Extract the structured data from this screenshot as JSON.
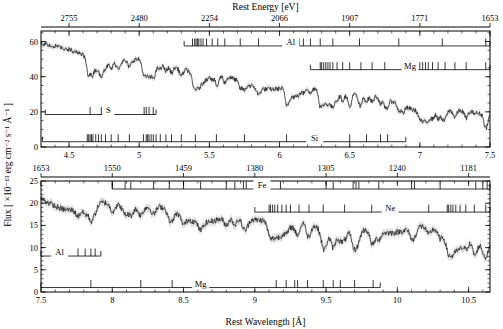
{
  "figure": {
    "type": "scientific-spectrum-figure",
    "top_axis_title": "Rest Energy [eV]",
    "bottom_axis_title": "Rest Wavelength [Å]",
    "y_axis_title": "Flux [ ×10⁻¹³ erg cm⁻² s⁻¹ Å⁻¹ ]"
  },
  "chart_data": {
    "type": "line",
    "title": "",
    "subtitle": "",
    "xlabel": "Rest Wavelength [Å]",
    "ylabel": "Flux [ ×10⁻¹³ erg cm⁻² s⁻¹ Å⁻¹ ]",
    "secondary_xlabel": "Rest Energy [eV]",
    "grid": false,
    "legend": "none",
    "panels": [
      {
        "name": "top-panel",
        "xlim": [
          4.3,
          7.5
        ],
        "ylim": [
          0,
          66
        ],
        "yticks": [
          0,
          20,
          40,
          60
        ],
        "ytick_labels": [
          "0",
          "20",
          "40",
          "60"
        ],
        "xticks": [
          4.5,
          5.0,
          5.5,
          6.0,
          6.5,
          7.0,
          7.5
        ],
        "xtick_labels": [
          "4.5",
          "5",
          "5.5",
          "6",
          "6.5",
          "7",
          "7.5"
        ],
        "energy_ticks": [
          2755,
          2480,
          2254,
          2066,
          1907,
          1771,
          1653
        ],
        "energy_tick_labels": [
          "2755",
          "2480",
          "2254",
          "2066",
          "1907",
          "1771",
          "1653"
        ],
        "energy_tick_wavelengths": [
          4.5,
          5.0,
          5.5,
          6.0,
          6.5,
          7.0,
          7.5
        ],
        "ion_markers": [
          {
            "label": "Al",
            "label_x": 6.08,
            "row_y": 57.5,
            "bar_start": 5.32,
            "bar_end": 7.5,
            "lines": [
              5.38,
              5.395,
              5.405,
              5.415,
              5.425,
              5.44,
              5.455,
              5.48,
              5.52,
              5.56,
              5.61,
              5.72,
              5.85,
              6.05,
              6.06,
              6.08,
              6.1,
              6.12,
              6.14,
              6.17,
              6.22,
              6.29,
              6.38,
              6.57,
              6.85,
              7.16,
              7.47
            ]
          },
          {
            "label": "Mg",
            "label_x": 6.93,
            "row_y": 44.0,
            "bar_start": 6.22,
            "bar_end": 7.5,
            "lines": [
              6.29,
              6.3,
              6.315,
              6.33,
              6.345,
              6.36,
              6.38,
              6.41,
              6.45,
              6.5,
              6.58,
              6.66,
              6.75,
              6.88,
              7.0,
              7.02,
              7.04,
              7.06,
              7.09,
              7.13,
              7.18,
              7.25,
              7.33,
              7.47
            ]
          },
          {
            "label": "S",
            "label_x": 4.78,
            "row_y": 18.5,
            "bar_start": 4.33,
            "bar_end": 5.12,
            "lines": [
              4.65,
              4.73,
              5.035,
              5.05,
              5.07,
              5.1
            ]
          },
          {
            "label": "Si",
            "label_x": 6.25,
            "row_y": 3.0,
            "bar_start": 4.31,
            "bar_end": 6.9,
            "lines": [
              4.63,
              4.64,
              4.65,
              4.66,
              4.67,
              4.69,
              4.71,
              4.73,
              4.76,
              4.8,
              4.85,
              4.93,
              5.03,
              5.05,
              5.06,
              5.07,
              5.085,
              5.1,
              5.12,
              5.15,
              5.19,
              5.23,
              5.3,
              5.4,
              5.55,
              5.75,
              6.05,
              6.5,
              6.62,
              6.72,
              6.77
            ]
          }
        ]
      },
      {
        "name": "bottom-panel",
        "xlim": [
          7.5,
          10.65
        ],
        "ylim": [
          0,
          25
        ],
        "yticks": [
          0,
          5,
          10,
          15,
          20,
          25
        ],
        "ytick_labels": [
          "0",
          "5",
          "10",
          "15",
          "20",
          "25"
        ],
        "xticks": [
          7.5,
          8.0,
          8.5,
          9.0,
          9.5,
          10.0,
          10.5
        ],
        "xtick_labels": [
          "7.5",
          "8",
          "8.5",
          "9",
          "9.5",
          "10",
          "10.5"
        ],
        "energy_ticks": [
          1653,
          1550,
          1459,
          1380,
          1305,
          1240,
          1181
        ],
        "energy_tick_labels": [
          "1653",
          "1550",
          "1459",
          "1380",
          "1305",
          "1240",
          "1181"
        ],
        "energy_tick_wavelengths": [
          7.5,
          8.0,
          8.5,
          9.0,
          9.5,
          10.0,
          10.5
        ],
        "ion_markers": [
          {
            "label": "Fe",
            "label_x": 9.05,
            "row_y": 23.2,
            "bar_start": 8.0,
            "bar_end": 10.65,
            "lines": [
              8.0,
              8.09,
              8.13,
              8.29,
              8.4,
              8.5,
              8.62,
              8.8,
              8.86,
              8.92,
              8.94,
              9.18,
              9.5,
              9.55,
              9.69,
              9.71,
              9.73,
              9.87,
              10.1,
              10.12,
              10.3,
              10.55,
              10.6,
              10.63
            ]
          },
          {
            "label": "Ne",
            "label_x": 9.95,
            "row_y": 18.0,
            "bar_start": 9.0,
            "bar_end": 10.65,
            "lines": [
              9.1,
              9.11,
              9.125,
              9.14,
              9.16,
              9.19,
              9.22,
              9.25,
              9.31,
              9.38,
              9.48,
              9.63,
              9.82,
              10.22,
              10.35,
              10.36,
              10.375,
              10.39,
              10.41,
              10.44,
              10.48,
              10.54,
              10.62
            ]
          },
          {
            "label": "Al",
            "label_x": 7.63,
            "row_y": 8.1,
            "bar_start": 7.5,
            "bar_end": 7.92,
            "lines": [
              7.76,
              7.81,
              7.85,
              7.88
            ]
          },
          {
            "label": "Mg",
            "label_x": 8.62,
            "row_y": 1.0,
            "bar_start": 7.5,
            "bar_end": 9.88,
            "lines": [
              7.85,
              8.2,
              8.42,
              9.15,
              9.22,
              9.28,
              9.3,
              9.37,
              9.48,
              9.55,
              9.6,
              9.7,
              9.83
            ]
          }
        ]
      }
    ]
  }
}
